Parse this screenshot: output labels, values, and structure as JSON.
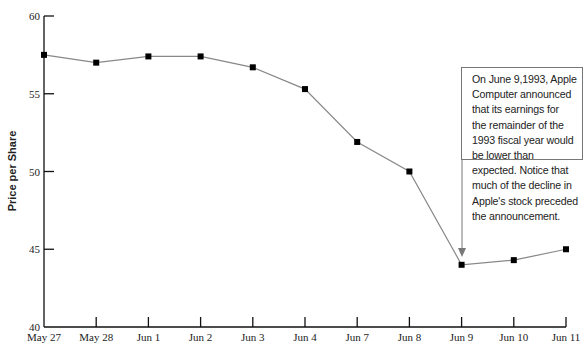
{
  "chart_data": {
    "type": "line",
    "title": "",
    "xlabel": "",
    "ylabel": "Price per Share",
    "ylim": [
      40,
      60
    ],
    "yticks": [
      40,
      45,
      50,
      55,
      60
    ],
    "grid": false,
    "legend": null,
    "categories": [
      "May 27",
      "May 28",
      "Jun 1",
      "Jun 2",
      "Jun 3",
      "Jun 4",
      "Jun 7",
      "Jun 8",
      "Jun 9",
      "Jun 10",
      "Jun 11"
    ],
    "series": [
      {
        "name": "Apple stock price",
        "values": [
          57.5,
          57.0,
          57.4,
          57.4,
          56.7,
          55.3,
          51.9,
          50.0,
          44.0,
          44.3,
          45.0
        ],
        "color": "#888888",
        "marker": "square",
        "marker_color": "#000000"
      }
    ],
    "annotations": [
      {
        "target": "Jun 9",
        "lines": [
          "On June 9,1993, Apple",
          "Computer announced",
          "that its earnings for",
          "the remainder of the",
          "1993 fiscal year would",
          "be lower than",
          "expected. Notice that",
          "much of the decline in",
          "Apple's stock preceded",
          "the announcement."
        ]
      }
    ]
  }
}
